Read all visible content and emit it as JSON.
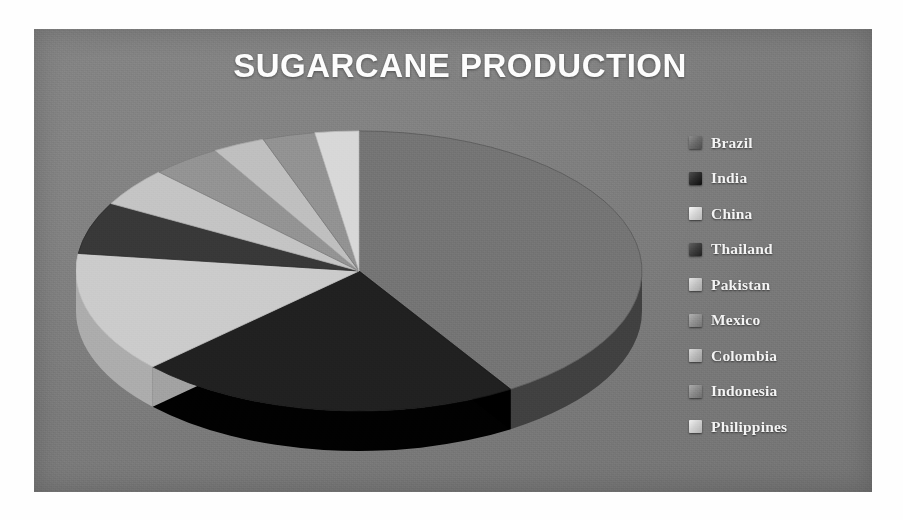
{
  "panel": {
    "background_color": "#7c7c7c",
    "border_color": "#ffffff"
  },
  "chart_title": "SUGARCANE PRODUCTION",
  "legend": {
    "items": [
      {
        "label": "Brazil",
        "color": "#6a6a6a",
        "marker": "square-swatch-icon"
      },
      {
        "label": "India",
        "color": "#2b2b2b",
        "marker": "square-swatch-icon"
      },
      {
        "label": "China",
        "color": "#d6d6d6",
        "marker": "square-swatch-icon"
      },
      {
        "label": "Thailand",
        "color": "#3d3d3d",
        "marker": "square-swatch-icon"
      },
      {
        "label": "Pakistan",
        "color": "#c4c4c4",
        "marker": "square-swatch-icon"
      },
      {
        "label": "Mexico",
        "color": "#909090",
        "marker": "square-swatch-icon"
      },
      {
        "label": "Colombia",
        "color": "#b9b9b9",
        "marker": "square-swatch-icon"
      },
      {
        "label": "Indonesia",
        "color": "#8a8a8a",
        "marker": "square-swatch-icon"
      },
      {
        "label": "Philippines",
        "color": "#cfcfcf",
        "marker": "square-swatch-icon"
      }
    ]
  },
  "chart_data": {
    "type": "pie",
    "title": "SUGARCANE PRODUCTION",
    "subtitle": "",
    "xlabel": "",
    "ylabel": "",
    "three_d": true,
    "exploded": false,
    "grid": false,
    "legend_position": "right",
    "value_unit": "share of production (%)",
    "labels": [
      "Brazil",
      "India",
      "China",
      "Thailand",
      "Pakistan",
      "Mexico",
      "Colombia",
      "Indonesia",
      "Philippines"
    ],
    "values": [
      41,
      22,
      14,
      6,
      4.5,
      4,
      3,
      3,
      2.5
    ],
    "colors": [
      "#6a6a6a",
      "#2b2b2b",
      "#d6d6d6",
      "#3d3d3d",
      "#c4c4c4",
      "#909090",
      "#b9b9b9",
      "#8a8a8a",
      "#cfcfcf"
    ],
    "slices": [
      {
        "label": "Brazil",
        "value": 41,
        "color": "#6a6a6a",
        "start_angle": 0,
        "end_angle": 147.6
      },
      {
        "label": "India",
        "value": 22,
        "color": "#2b2b2b",
        "start_angle": 147.6,
        "end_angle": 226.8
      },
      {
        "label": "China",
        "value": 14,
        "color": "#d6d6d6",
        "start_angle": 226.8,
        "end_angle": 277.2
      },
      {
        "label": "Thailand",
        "value": 6,
        "color": "#3d3d3d",
        "start_angle": 277.2,
        "end_angle": 298.8
      },
      {
        "label": "Pakistan",
        "value": 4.5,
        "color": "#c4c4c4",
        "start_angle": 298.8,
        "end_angle": 315.0
      },
      {
        "label": "Mexico",
        "value": 4,
        "color": "#909090",
        "start_angle": 315.0,
        "end_angle": 329.4
      },
      {
        "label": "Colombia",
        "value": 3,
        "color": "#b9b9b9",
        "start_angle": 329.4,
        "end_angle": 340.2
      },
      {
        "label": "Indonesia",
        "value": 3,
        "color": "#8a8a8a",
        "start_angle": 340.2,
        "end_angle": 351.0
      },
      {
        "label": "Philippines",
        "value": 2.5,
        "color": "#cfcfcf",
        "start_angle": 351.0,
        "end_angle": 360.0
      }
    ]
  }
}
